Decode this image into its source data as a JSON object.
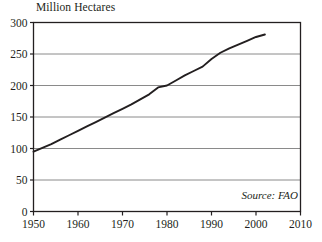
{
  "chart_data": {
    "type": "line",
    "title": "Million Hectares",
    "xlabel": "",
    "ylabel": "Million Hectares",
    "xlim": [
      1950,
      2010
    ],
    "ylim": [
      0,
      300
    ],
    "grid": true,
    "legend": null,
    "annotations": [
      {
        "name": "source",
        "text": "Source: FAO",
        "position": "bottom-right-inside"
      }
    ],
    "xticks": [
      1950,
      1960,
      1970,
      1980,
      1990,
      2000,
      2010
    ],
    "xtick_labels": [
      "1950",
      "1960",
      "1970",
      "1980",
      "1990",
      "2000",
      "2010"
    ],
    "yticks": [
      0,
      50,
      100,
      150,
      200,
      250,
      300
    ],
    "ytick_labels": [
      "0",
      "50",
      "100",
      "150",
      "200",
      "250",
      "300"
    ],
    "series": [
      {
        "name": "Irrigated Area",
        "color": "#231f20",
        "x": [
          1950,
          1952,
          1954,
          1956,
          1958,
          1960,
          1962,
          1964,
          1966,
          1968,
          1970,
          1972,
          1974,
          1976,
          1978,
          1980,
          1982,
          1984,
          1986,
          1988,
          1990,
          1992,
          1994,
          1996,
          1998,
          2000,
          2002
        ],
        "y": [
          95,
          101,
          107,
          114,
          121,
          128,
          135,
          142,
          149,
          156,
          163,
          170,
          178,
          186,
          197,
          200,
          208,
          216,
          223,
          230,
          242,
          252,
          259,
          265,
          271,
          277,
          281
        ]
      }
    ]
  },
  "colors": {
    "line": "#231f20",
    "frame": "#231f20",
    "gridline": "#8a8a8a",
    "text": "#231f20",
    "background": "#ffffff"
  },
  "source": {
    "label": "Source: FAO"
  }
}
